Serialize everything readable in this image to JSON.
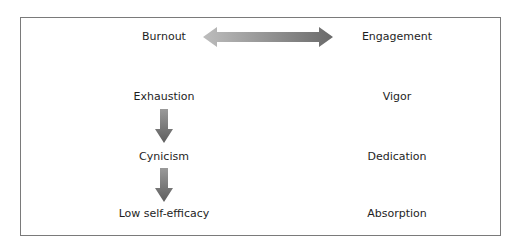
{
  "diagram": {
    "left_column": {
      "header": "Burnout",
      "items": [
        "Exhaustion",
        "Cynicism",
        "Low self-efficacy"
      ]
    },
    "right_column": {
      "header": "Engagement",
      "items": [
        "Vigor",
        "Dedication",
        "Absorption"
      ]
    },
    "connectors": {
      "header_link": "double-arrow-horizontal",
      "left_flow": [
        "down-arrow",
        "down-arrow"
      ]
    },
    "colors": {
      "border": "#7a7a7a",
      "arrow_dark": "#6e6e6e",
      "arrow_light": "#b8b8b8",
      "text": "#1e1e1e"
    }
  }
}
